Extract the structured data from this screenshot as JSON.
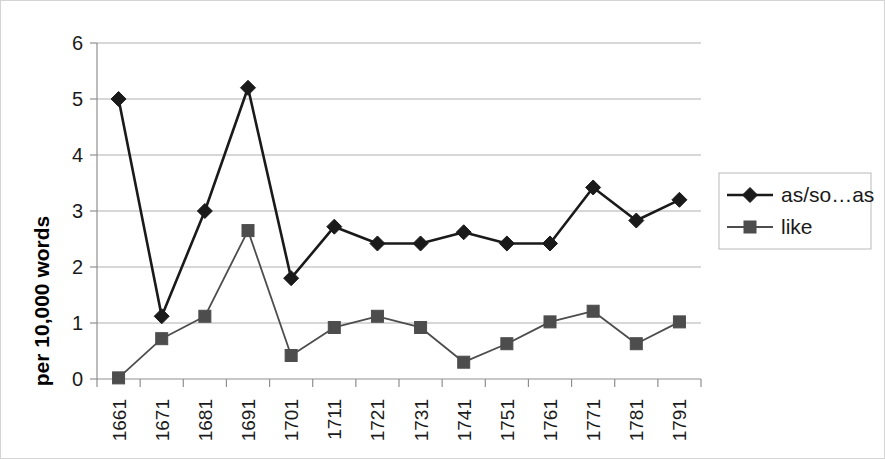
{
  "chart_data": {
    "type": "line",
    "title": "",
    "subtitle": "",
    "xlabel": "",
    "ylabel": "per 10,000 words",
    "categories": [
      "1661",
      "1671",
      "1681",
      "1691",
      "1701",
      "1711",
      "1721",
      "1731",
      "1741",
      "1751",
      "1761",
      "1771",
      "1781",
      "1791"
    ],
    "series": [
      {
        "name": "as/so…as",
        "marker": "diamond",
        "color": "#1a1a1a",
        "values": [
          5.0,
          1.12,
          3.0,
          5.2,
          1.8,
          2.72,
          2.42,
          2.42,
          2.62,
          2.42,
          2.42,
          3.42,
          2.83,
          3.2
        ]
      },
      {
        "name": "like",
        "marker": "square",
        "color": "#4d4d4d",
        "values": [
          0.02,
          0.72,
          1.12,
          2.65,
          0.42,
          0.92,
          1.12,
          0.92,
          0.3,
          0.63,
          1.02,
          1.21,
          0.63,
          1.02
        ]
      }
    ],
    "ylim": [
      0,
      6
    ],
    "yticks": [
      0,
      1,
      2,
      3,
      4,
      5,
      6
    ],
    "ytick_labels": [
      "0",
      "1",
      "2",
      "3",
      "4",
      "5",
      "6"
    ],
    "grid": "horizontal",
    "legend_position": "right",
    "x_tick_label_rotation": -90
  },
  "legend": {
    "entries": [
      {
        "label": "as/so…as"
      },
      {
        "label": "like"
      }
    ]
  },
  "axes": {
    "y_title": "per 10,000 words"
  },
  "colors": {
    "series_1": "#1a1a1a",
    "series_2": "#4d4d4d",
    "gridline": "#b0b0b0",
    "axis": "#8f8f8f",
    "frame": "#d4d4d4",
    "background": "#ffffff"
  }
}
